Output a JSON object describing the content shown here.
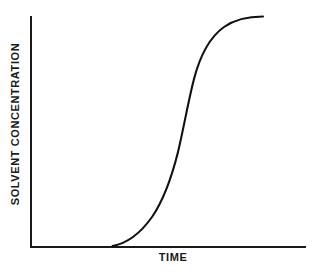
{
  "chart_data": {
    "type": "line",
    "title": "",
    "subtitle": "",
    "xlabel": "TIME",
    "ylabel": "SOLVENT CONCENTRATION",
    "legend": [],
    "legend_position": "none",
    "grid": false,
    "xlim": [
      0,
      1
    ],
    "ylim": [
      0,
      1
    ],
    "xticks": [],
    "yticks": [],
    "xticklabels": [],
    "yticklabels": [],
    "annotations": [],
    "series": [
      {
        "name": "solvent concentration over time",
        "shape": "sigmoid",
        "line_color": "#111111",
        "line_width": 2,
        "x": [
          0.3,
          0.34,
          0.38,
          0.42,
          0.46,
          0.5,
          0.53,
          0.56,
          0.58,
          0.61,
          0.64,
          0.67,
          0.7,
          0.74,
          0.79,
          0.84,
          0.89,
          0.94,
          1.0
        ],
        "y": [
          0.01,
          0.04,
          0.08,
          0.13,
          0.2,
          0.29,
          0.38,
          0.48,
          0.57,
          0.66,
          0.74,
          0.8,
          0.85,
          0.9,
          0.94,
          0.96,
          0.98,
          0.99,
          1.0
        ]
      }
    ],
    "axis_color": "#1a1a1a",
    "background_color": "#ffffff",
    "curve_path": "M 112.5 246 C 126 243.5 140 234 152 217 C 162 202.5 170.5 182 178 152 C 184 127 188 102 194 79 C 200.5 54 210 37 224 27 C 236 18.5 250 16.5 263 16.5"
  },
  "axes": {
    "y_axis_x": 31,
    "y_axis_top": 17,
    "y_axis_bottom": 247,
    "x_axis_y": 247,
    "x_axis_left": 31,
    "x_axis_right": 305
  }
}
